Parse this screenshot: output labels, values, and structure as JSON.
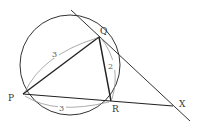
{
  "figure": {
    "type": "circle-tangent-geometry",
    "points": {
      "P": {
        "label": "P",
        "x": 23,
        "y": 94
      },
      "Q": {
        "label": "Q",
        "x": 99,
        "y": 37
      },
      "R": {
        "label": "R",
        "x": 111,
        "y": 101
      },
      "X": {
        "label": "X",
        "x": 173,
        "y": 106
      }
    },
    "circle": {
      "cx": 70,
      "cy": 65,
      "r": 50
    },
    "segments": [
      "PQ",
      "QR",
      "PR",
      "RX",
      "tangent at Q through X"
    ],
    "measures": {
      "PQ": "3",
      "PR": "3",
      "QR": "2"
    },
    "colors": {
      "stroke": "#333333",
      "measure_arc": "#888888"
    }
  }
}
